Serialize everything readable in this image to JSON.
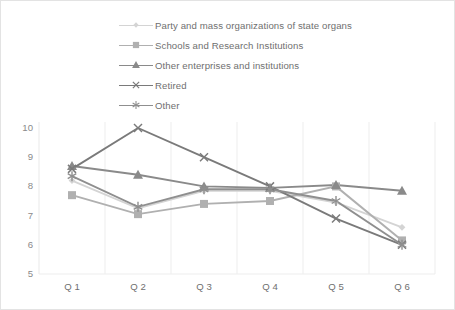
{
  "chart_data": {
    "type": "line",
    "title": "",
    "xlabel": "",
    "ylabel": "",
    "categories": [
      "Q1",
      "Q2",
      "Q3",
      "Q4",
      "Q5",
      "Q6"
    ],
    "ylim": [
      5,
      10
    ],
    "yticks": [
      5,
      6,
      7,
      8,
      9,
      10
    ],
    "grid": "vertical-only",
    "legend_position": "top",
    "series": [
      {
        "name": "Party and mass organizations of state organs",
        "marker": "diamond",
        "color": "#d4d4d4",
        "values": [
          8.2,
          7.25,
          7.85,
          7.85,
          7.45,
          6.6
        ]
      },
      {
        "name": "Schools and Research Institutions",
        "marker": "square",
        "color": "#b0b0b0",
        "values": [
          7.7,
          7.05,
          7.4,
          7.5,
          8.0,
          6.15
        ]
      },
      {
        "name": "Other enterprises and institutions",
        "marker": "triangle",
        "color": "#8a8a8a",
        "values": [
          8.7,
          8.4,
          8.0,
          7.95,
          8.05,
          7.85
        ]
      },
      {
        "name": "Retired",
        "marker": "cross",
        "color": "#7a7a7a",
        "values": [
          8.6,
          10.0,
          9.0,
          8.0,
          6.9,
          6.0
        ]
      },
      {
        "name": "Other",
        "marker": "asterisk",
        "color": "#8f8f8f",
        "values": [
          8.35,
          7.3,
          7.9,
          7.9,
          7.5,
          6.0
        ]
      }
    ]
  },
  "legend": {
    "items": [
      {
        "label": "Party and mass organizations of state organs"
      },
      {
        "label": "Schools and Research Institutions"
      },
      {
        "label": "Other enterprises and institutions"
      },
      {
        "label": "Retired"
      },
      {
        "label": "Other"
      }
    ]
  },
  "axis": {
    "y_labels": [
      "10",
      "9",
      "8",
      "7",
      "6",
      "5"
    ],
    "x_labels": [
      "Q 1",
      "Q 2",
      "Q 3",
      "Q 4",
      "Q 5",
      "Q 6"
    ]
  },
  "colors": {
    "frame": "#e3e3e3",
    "gridline": "#ededed",
    "axis_text": "#7c7c7c",
    "plot_background": "#ffffff"
  }
}
